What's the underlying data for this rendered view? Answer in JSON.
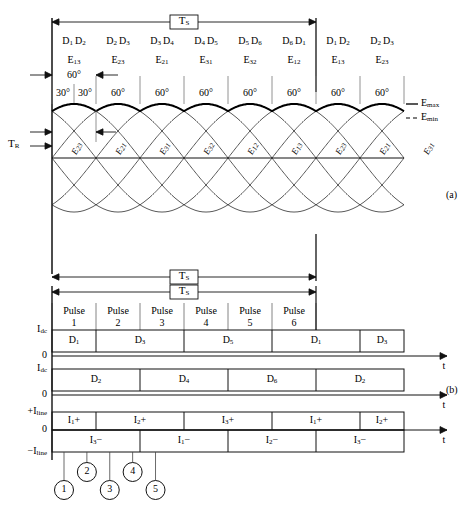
{
  "figure": {
    "panel_a_label": "(a)",
    "panel_b_label": "(b)",
    "period_label": "T",
    "period_sub": "S",
    "tr_label": "T",
    "tr_sub": "R",
    "time_axis_label": "t",
    "emax_label": "E",
    "emax_sub": "max",
    "emin_label": "E",
    "emin_sub": "min",
    "zero_label": "0",
    "idc_label": "I",
    "idc_sub": "dc",
    "iline_pos_label": "+I",
    "iline_neg_label": "−I",
    "iline_sub": "line"
  },
  "top_segments": [
    {
      "devices": [
        "D1",
        "D2"
      ],
      "emf": "E13",
      "angle": "60°"
    },
    {
      "devices": [
        "D2",
        "D3"
      ],
      "emf": "E23",
      "angle": "60°"
    },
    {
      "devices": [
        "D3",
        "D4"
      ],
      "emf": "E21",
      "angle": "60°"
    },
    {
      "devices": [
        "D4",
        "D5"
      ],
      "emf": "E31",
      "angle": "60°"
    },
    {
      "devices": [
        "D5",
        "D6"
      ],
      "emf": "E32",
      "angle": "60°"
    },
    {
      "devices": [
        "D6",
        "D1"
      ],
      "emf": "E12",
      "angle": "60°"
    },
    {
      "devices": [
        "D1",
        "D2"
      ],
      "emf": "E13",
      "angle": "60°"
    },
    {
      "devices": [
        "D2",
        "D3"
      ],
      "emf": "E23",
      "angle": "60°"
    }
  ],
  "first_cell_angles": {
    "total": "60°",
    "left_half": "30°",
    "right_half": "30°"
  },
  "wave_labels": [
    "E23",
    "E21",
    "E31",
    "E32",
    "E12",
    "E13",
    "E23",
    "E21",
    "E31"
  ],
  "pulses": [
    {
      "name": "Pulse",
      "number": "1"
    },
    {
      "name": "Pulse",
      "number": "2"
    },
    {
      "name": "Pulse",
      "number": "3"
    },
    {
      "name": "Pulse",
      "number": "4"
    },
    {
      "name": "Pulse",
      "number": "5"
    },
    {
      "name": "Pulse",
      "number": "6"
    }
  ],
  "row_odd_devices": [
    {
      "label": "D1",
      "start": 0,
      "end": 1
    },
    {
      "label": "D3",
      "start": 1,
      "end": 3
    },
    {
      "label": "D5",
      "start": 3,
      "end": 5
    },
    {
      "label": "D1",
      "start": 5,
      "end": 7
    },
    {
      "label": "D3",
      "start": 7,
      "end": 8
    }
  ],
  "row_even_devices": [
    {
      "label": "D2",
      "start": 0,
      "end": 2
    },
    {
      "label": "D4",
      "start": 2,
      "end": 4
    },
    {
      "label": "D6",
      "start": 4,
      "end": 6
    },
    {
      "label": "D2",
      "start": 6,
      "end": 8
    }
  ],
  "row_line_positive": [
    {
      "label": "I1 +",
      "start": 0,
      "end": 1
    },
    {
      "label": "I2 +",
      "start": 1,
      "end": 3
    },
    {
      "label": "I3 +",
      "start": 3,
      "end": 5
    },
    {
      "label": "I1 +",
      "start": 5,
      "end": 7
    },
    {
      "label": "I2 +",
      "start": 7,
      "end": 8
    }
  ],
  "row_line_negative": [
    {
      "label": "I3 −",
      "start": 0,
      "end": 2
    },
    {
      "label": "I1 −",
      "start": 2,
      "end": 4
    },
    {
      "label": "I2 −",
      "start": 4,
      "end": 6
    },
    {
      "label": "I3 −",
      "start": 6,
      "end": 8
    }
  ],
  "callouts": [
    {
      "number": "1",
      "tick": 0
    },
    {
      "number": "2",
      "tick": 1
    },
    {
      "number": "3",
      "tick": 2
    },
    {
      "number": "4",
      "tick": 3
    },
    {
      "number": "5",
      "tick": 4
    }
  ],
  "colors": {
    "ink": "#000000",
    "thin": "#555555",
    "paper": "#ffffff"
  }
}
